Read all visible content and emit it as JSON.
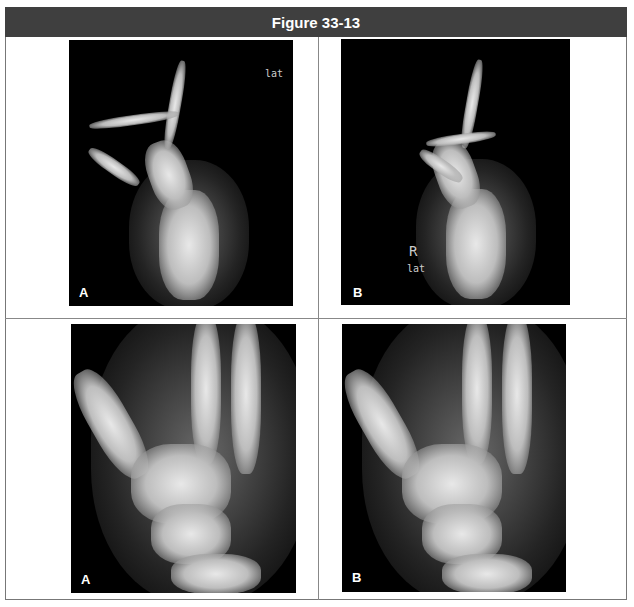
{
  "figure": {
    "title": "Figure 33-13",
    "panels": [
      {
        "position": "top-left",
        "label": "A",
        "marker": "lat",
        "view": "lateral hand radiograph"
      },
      {
        "position": "top-right",
        "label": "B",
        "marker_letter": "R",
        "marker": "lat",
        "view": "lateral hand radiograph"
      },
      {
        "position": "bottom-left",
        "label": "A",
        "view": "close-up lateral wrist radiograph"
      },
      {
        "position": "bottom-right",
        "label": "B",
        "view": "close-up lateral wrist radiograph"
      }
    ]
  }
}
